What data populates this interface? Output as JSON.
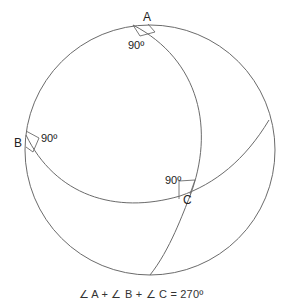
{
  "diagram": {
    "colors": {
      "stroke": "#6b6b6b",
      "text": "#222222"
    },
    "vertices": [
      {
        "id": "A",
        "label": "A",
        "angle_label": "90º"
      },
      {
        "id": "B",
        "label": "B",
        "angle_label": "90º"
      },
      {
        "id": "C",
        "label": "C",
        "angle_label": "90º"
      }
    ],
    "caption": "∠ A + ∠ B + ∠ C  =  270º"
  }
}
